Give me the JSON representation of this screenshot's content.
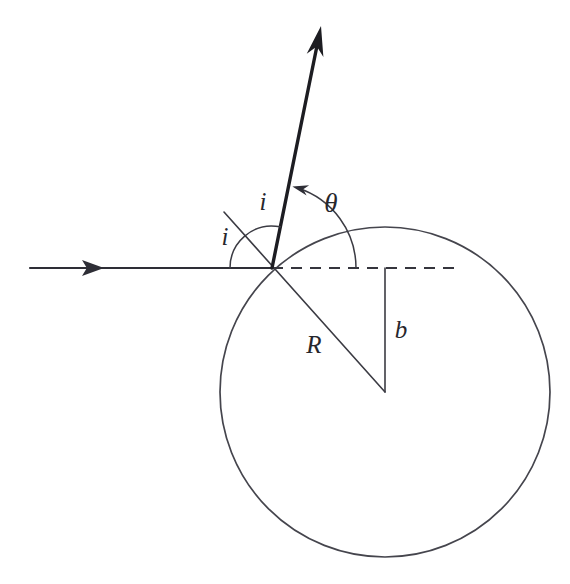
{
  "figure": {
    "title": "Ray refraction at a spherical surface",
    "background_color": "#ffffff",
    "line_color": "#3b3b43",
    "width": 570,
    "height": 584
  },
  "labels": {
    "incidence_angle_upper": "i",
    "incidence_angle_lower": "i",
    "deflection_angle": "θ",
    "radius": "R",
    "impact_parameter": "b"
  },
  "geometry": {
    "circle": {
      "center_x": 385,
      "center_y": 392,
      "radius": 165
    },
    "impact_point": {
      "x": 272,
      "y": 268
    },
    "incident_ray": {
      "start_x": 30,
      "start_y": 268,
      "end_x": 272,
      "end_y": 268,
      "arrow_x": 104,
      "arrow_y": 268
    },
    "outgoing_ray": {
      "start_x": 272,
      "start_y": 268,
      "end_x": 321,
      "end_y": 26
    },
    "normal_line": {
      "start_x": 224,
      "start_y": 212,
      "end_x": 385,
      "end_y": 392
    },
    "dashed_axis": {
      "start_x": 272,
      "start_y": 268,
      "end_x": 456,
      "end_y": 268
    },
    "impact_parameter_line": {
      "start_x": 385,
      "start_y": 268,
      "end_x": 385,
      "end_y": 392
    },
    "arc_incidence_radius": 42,
    "arc_theta_radius": 84
  },
  "label_positions": {
    "i_upper": {
      "x": 263,
      "y": 204
    },
    "i_lower": {
      "x": 225,
      "y": 239
    },
    "theta": {
      "x": 331,
      "y": 206
    },
    "R": {
      "x": 314,
      "y": 347
    },
    "b": {
      "x": 401,
      "y": 332
    }
  }
}
